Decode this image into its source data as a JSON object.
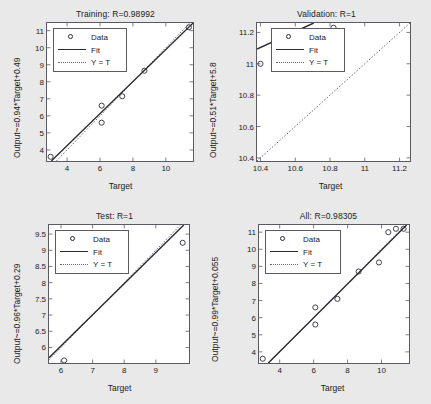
{
  "figure": {
    "background_color": "#e9e9e9",
    "axes_background_color": "#ffffff",
    "axes_border_color": "#5a5a66",
    "fit_line_color": "#2a2a34",
    "identity_line_color": "#6b6b78",
    "marker_color": "#2a2a34"
  },
  "legend": {
    "data_label": "Data",
    "fit_label": "Fit",
    "identity_label": "Y = T"
  },
  "chart_data": [
    {
      "id": "training",
      "type": "scatter",
      "title": "Training: R=0.98992",
      "r_value": "0.98992",
      "xlabel": "Target",
      "ylabel": "Output~=0.94*Target+0.49",
      "fit_slope": 0.94,
      "fit_intercept": 0.49,
      "xlim": [
        2.78,
        11.65
      ],
      "ylim": [
        3.35,
        11.45
      ],
      "xticks": [
        4,
        6,
        8,
        10
      ],
      "xticklabels": [
        "4",
        "6",
        "8",
        "10"
      ],
      "yticks": [
        4,
        5,
        6,
        7,
        8,
        9,
        10,
        11
      ],
      "yticklabels": [
        "4",
        "5",
        "6",
        "7",
        "8",
        "9",
        "10",
        "11"
      ],
      "grid": false,
      "legend_position": "upper-left",
      "points": [
        {
          "x": 3.0,
          "y": 3.6
        },
        {
          "x": 6.1,
          "y": 6.6
        },
        {
          "x": 6.1,
          "y": 5.6
        },
        {
          "x": 7.35,
          "y": 7.15
        },
        {
          "x": 8.7,
          "y": 8.65
        },
        {
          "x": 11.4,
          "y": 11.2
        }
      ]
    },
    {
      "id": "validation",
      "type": "scatter",
      "title": "Validation: R=1",
      "r_value": "1",
      "xlabel": "Target",
      "ylabel": "Output~=0.51*Target+5.8",
      "fit_slope": 0.51,
      "fit_intercept": 5.8,
      "xlim": [
        10.38,
        11.26
      ],
      "ylim": [
        10.38,
        11.26
      ],
      "xticks": [
        10.4,
        10.6,
        10.8,
        11,
        11.2
      ],
      "xticklabels": [
        "10.4",
        "10.6",
        "10.8",
        "11",
        "11.2"
      ],
      "yticks": [
        10.4,
        10.6,
        10.8,
        11,
        11.2
      ],
      "yticklabels": [
        "10.4",
        "10.6",
        "10.8",
        "11",
        "11.2"
      ],
      "grid": false,
      "legend_position": "upper-left",
      "points": [
        {
          "x": 10.4,
          "y": 11.0
        },
        {
          "x": 10.82,
          "y": 11.23
        }
      ]
    },
    {
      "id": "test",
      "type": "scatter",
      "title": "Test: R=1",
      "r_value": "1",
      "xlabel": "Target",
      "ylabel": "Output~=0.96*Target+0.29",
      "fit_slope": 0.96,
      "fit_intercept": 0.29,
      "xlim": [
        5.62,
        10.05
      ],
      "ylim": [
        5.52,
        9.78
      ],
      "xticks": [
        6,
        7,
        8,
        9
      ],
      "xticklabels": [
        "6",
        "7",
        "8",
        "9"
      ],
      "yticks": [
        6,
        6.5,
        7,
        7.5,
        8,
        8.5,
        9,
        9.5
      ],
      "yticklabels": [
        "6",
        "6.5",
        "7",
        "7.5",
        "8",
        "8.5",
        "9",
        "9.5"
      ],
      "grid": false,
      "legend_position": "upper-left",
      "points": [
        {
          "x": 6.1,
          "y": 5.6
        },
        {
          "x": 9.85,
          "y": 9.23
        }
      ]
    },
    {
      "id": "all",
      "type": "scatter",
      "title": "All: R=0.98305",
      "r_value": "0.98305",
      "xlabel": "Target",
      "ylabel": "Output~=0.99*Target+0.055",
      "fit_slope": 0.99,
      "fit_intercept": 0.055,
      "xlim": [
        2.78,
        11.62
      ],
      "ylim": [
        3.35,
        11.42
      ],
      "xticks": [
        4,
        6,
        8,
        10
      ],
      "xticklabels": [
        "4",
        "6",
        "8",
        "10"
      ],
      "yticks": [
        4,
        5,
        6,
        7,
        8,
        9,
        10,
        11
      ],
      "yticklabels": [
        "4",
        "5",
        "6",
        "7",
        "8",
        "9",
        "10",
        "11"
      ],
      "grid": false,
      "legend_position": "upper-left",
      "points": [
        {
          "x": 3.0,
          "y": 3.6
        },
        {
          "x": 6.1,
          "y": 6.6
        },
        {
          "x": 6.1,
          "y": 5.6
        },
        {
          "x": 7.4,
          "y": 7.1
        },
        {
          "x": 8.65,
          "y": 8.7
        },
        {
          "x": 9.85,
          "y": 9.23
        },
        {
          "x": 10.4,
          "y": 11.0
        },
        {
          "x": 10.85,
          "y": 11.2
        },
        {
          "x": 11.3,
          "y": 11.2
        }
      ]
    }
  ]
}
